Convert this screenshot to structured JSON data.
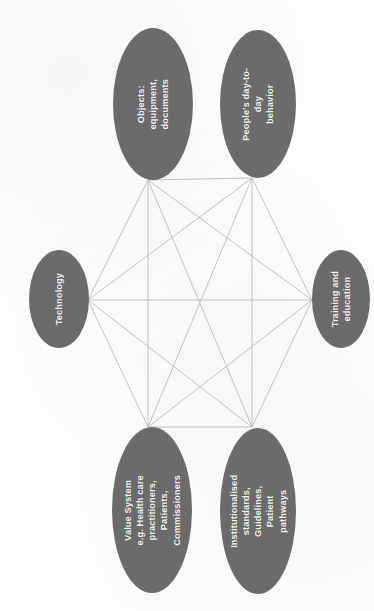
{
  "figure": {
    "orientation": "rotated-90",
    "background_color": "#fdfdfc",
    "node_fill_color": "#6b6b6b",
    "node_text_color": "#f4f4f2",
    "edge_color": "#b3b3b3",
    "edge_width": 0.8
  },
  "nodes": [
    {
      "id": "objects",
      "label": "Objects: equipment,\ndocuments",
      "cx": 152.5,
      "cy": 104,
      "rx": 40,
      "ry": 76,
      "anchor_x": 148,
      "anchor_y": 180,
      "font_size": 9.2
    },
    {
      "id": "behavior",
      "label": "People's day-to-day\nbehavior",
      "cx": 257.5,
      "cy": 104,
      "rx": 38,
      "ry": 74,
      "anchor_x": 252,
      "anchor_y": 178,
      "font_size": 9.2
    },
    {
      "id": "technology",
      "label": "Technology",
      "cx": 58.5,
      "cy": 299,
      "rx": 30,
      "ry": 49,
      "anchor_x": 88,
      "anchor_y": 300,
      "font_size": 9.2
    },
    {
      "id": "training",
      "label": "Training and\neducation",
      "cx": 341,
      "cy": 299,
      "rx": 29,
      "ry": 49,
      "anchor_x": 312,
      "anchor_y": 300,
      "font_size": 9.2
    },
    {
      "id": "value-system",
      "label": "Value System\ne.g. Health care\npractitioners,\nPatients,\nCommissioners",
      "cx": 152,
      "cy": 510,
      "rx": 40,
      "ry": 83,
      "anchor_x": 148,
      "anchor_y": 427,
      "font_size": 9.2
    },
    {
      "id": "standards",
      "label": "Institutionalised\nstandards,\nGuidelines, Patient\npathways",
      "cx": 257.5,
      "cy": 511,
      "rx": 38,
      "ry": 83,
      "anchor_x": 252,
      "anchor_y": 427,
      "font_size": 9.2
    }
  ],
  "edges": [
    {
      "from": "objects",
      "to": "behavior"
    },
    {
      "from": "objects",
      "to": "technology"
    },
    {
      "from": "objects",
      "to": "training"
    },
    {
      "from": "objects",
      "to": "value-system"
    },
    {
      "from": "objects",
      "to": "standards"
    },
    {
      "from": "behavior",
      "to": "technology"
    },
    {
      "from": "behavior",
      "to": "training"
    },
    {
      "from": "behavior",
      "to": "value-system"
    },
    {
      "from": "behavior",
      "to": "standards"
    },
    {
      "from": "technology",
      "to": "training"
    },
    {
      "from": "technology",
      "to": "value-system"
    },
    {
      "from": "technology",
      "to": "standards"
    },
    {
      "from": "training",
      "to": "value-system"
    },
    {
      "from": "training",
      "to": "standards"
    },
    {
      "from": "value-system",
      "to": "standards"
    }
  ]
}
